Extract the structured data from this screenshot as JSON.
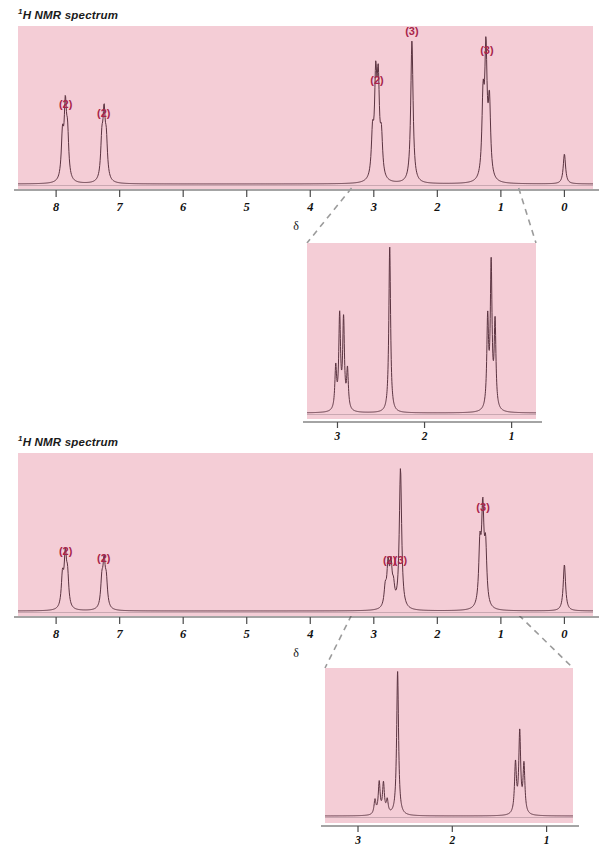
{
  "figure": {
    "width": 611,
    "height": 863,
    "background": "#ffffff",
    "plot_background": "#f4cdd6",
    "trace_color": "#5a3340",
    "label_color": "#a8244a",
    "axis_color": "#4a4a4a",
    "connector_color": "#9b9b9b"
  },
  "panels": [
    {
      "id": "spectrum-1",
      "title": "H NMR spectrum",
      "title_superscript": "1",
      "axis_label": "δ",
      "axis_ticks": [
        "8",
        "7",
        "6",
        "5",
        "4",
        "3",
        "2",
        "1",
        "0"
      ],
      "axis_range": [
        8.6,
        -0.45
      ],
      "annotations": [
        {
          "text": "(2)",
          "ppm": 7.85
        },
        {
          "text": "(2)",
          "ppm": 7.25
        },
        {
          "text": "(2)",
          "ppm": 2.95
        },
        {
          "text": "(3)",
          "ppm": 2.4
        },
        {
          "text": "(3)",
          "ppm": 1.22
        }
      ],
      "chart_data": {
        "type": "line",
        "title": "1H NMR spectrum",
        "xlabel": "δ",
        "ylabel": "",
        "xlim": [
          8.6,
          -0.45
        ],
        "ylim": [
          0,
          1
        ],
        "x_inverted": true,
        "grid": false,
        "peaks": [
          {
            "ppm": 7.86,
            "height": 0.46,
            "multiplicity": "d",
            "protons": 2,
            "lines": [
              7.9,
              7.855,
              7.82
            ],
            "label": "(2)"
          },
          {
            "ppm": 7.25,
            "height": 0.4,
            "multiplicity": "d",
            "protons": 2,
            "lines": [
              7.28,
              7.245,
              7.21
            ],
            "label": "(2)"
          },
          {
            "ppm": 2.95,
            "height": 0.62,
            "multiplicity": "q",
            "protons": 2,
            "lines": [
              3.02,
              2.97,
              2.93,
              2.88
            ],
            "label": "(2)"
          },
          {
            "ppm": 2.4,
            "height": 0.95,
            "multiplicity": "s",
            "protons": 3,
            "lines": [
              2.4
            ],
            "label": "(3)"
          },
          {
            "ppm": 1.22,
            "height": 0.82,
            "multiplicity": "t",
            "protons": 3,
            "lines": [
              1.28,
              1.235,
              1.18
            ],
            "label": "(3)"
          },
          {
            "ppm": 0.0,
            "height": 0.2,
            "multiplicity": "s",
            "protons": 0,
            "lines": [
              0.0
            ],
            "label": ""
          }
        ]
      }
    },
    {
      "id": "inset-1",
      "axis_ticks": [
        "3",
        "2",
        "1"
      ],
      "axis_range": [
        3.35,
        0.72
      ],
      "chart_data": {
        "type": "line",
        "title": "expansion 3–1 ppm",
        "xlabel": "",
        "ylabel": "",
        "xlim": [
          3.35,
          0.72
        ],
        "ylim": [
          0,
          1
        ],
        "x_inverted": true,
        "grid": false,
        "peaks": [
          {
            "ppm": 2.95,
            "height": 0.56,
            "multiplicity": "q",
            "protons": 2,
            "lines": [
              3.02,
              2.975,
              2.93,
              2.885
            ]
          },
          {
            "ppm": 2.4,
            "height": 1.0,
            "multiplicity": "s",
            "protons": 3,
            "lines": [
              2.4
            ]
          },
          {
            "ppm": 1.22,
            "height": 0.86,
            "multiplicity": "t",
            "protons": 3,
            "lines": [
              1.275,
              1.235,
              1.19
            ]
          }
        ]
      }
    },
    {
      "id": "spectrum-2",
      "title": "H NMR spectrum",
      "title_superscript": "1",
      "axis_label": "δ",
      "axis_ticks": [
        "8",
        "7",
        "6",
        "5",
        "4",
        "3",
        "2",
        "1",
        "0"
      ],
      "axis_range": [
        8.6,
        -0.45
      ],
      "annotations": [
        {
          "text": "(2)",
          "ppm": 7.85
        },
        {
          "text": "(2)",
          "ppm": 7.25
        },
        {
          "text": "(2)",
          "ppm": 2.75
        },
        {
          "text": "(3)",
          "ppm": 2.58
        },
        {
          "text": "(3)",
          "ppm": 1.28
        }
      ],
      "chart_data": {
        "type": "line",
        "title": "1H NMR spectrum",
        "xlabel": "δ",
        "ylabel": "",
        "xlim": [
          8.6,
          -0.45
        ],
        "ylim": [
          0,
          1
        ],
        "x_inverted": true,
        "grid": false,
        "peaks": [
          {
            "ppm": 7.86,
            "height": 0.33,
            "multiplicity": "d",
            "protons": 2,
            "lines": [
              7.9,
              7.855,
              7.82
            ],
            "label": "(2)"
          },
          {
            "ppm": 7.25,
            "height": 0.28,
            "multiplicity": "d",
            "protons": 2,
            "lines": [
              7.28,
              7.245,
              7.21
            ],
            "label": "(2)"
          },
          {
            "ppm": 2.75,
            "height": 0.27,
            "multiplicity": "q",
            "protons": 2,
            "lines": [
              2.82,
              2.775,
              2.73,
              2.69
            ],
            "label": "(2)"
          },
          {
            "ppm": 2.58,
            "height": 0.94,
            "multiplicity": "s",
            "protons": 3,
            "lines": [
              2.58
            ],
            "label": "(3)"
          },
          {
            "ppm": 1.28,
            "height": 0.62,
            "multiplicity": "t",
            "protons": 3,
            "lines": [
              1.33,
              1.285,
              1.24
            ],
            "label": "(3)"
          },
          {
            "ppm": 0.0,
            "height": 0.31,
            "multiplicity": "s",
            "protons": 0,
            "lines": [
              0.0
            ],
            "label": ""
          }
        ]
      }
    },
    {
      "id": "inset-2",
      "axis_ticks": [
        "3",
        "2",
        "1"
      ],
      "axis_range": [
        3.35,
        0.72
      ],
      "chart_data": {
        "type": "line",
        "title": "expansion 3–1 ppm",
        "xlabel": "",
        "ylabel": "",
        "xlim": [
          3.35,
          0.72
        ],
        "ylim": [
          0,
          1
        ],
        "x_inverted": true,
        "grid": false,
        "peaks": [
          {
            "ppm": 2.75,
            "height": 0.22,
            "multiplicity": "q",
            "protons": 2,
            "lines": [
              2.82,
              2.775,
              2.73,
              2.69
            ]
          },
          {
            "ppm": 2.58,
            "height": 1.0,
            "multiplicity": "s",
            "protons": 3,
            "lines": [
              2.58
            ]
          },
          {
            "ppm": 1.28,
            "height": 0.56,
            "multiplicity": "t",
            "protons": 3,
            "lines": [
              1.33,
              1.285,
              1.24
            ]
          }
        ]
      }
    }
  ],
  "connectors": [
    {
      "from_panel": "spectrum-1",
      "to_panel": "inset-1"
    },
    {
      "from_panel": "spectrum-2",
      "to_panel": "inset-2"
    }
  ]
}
